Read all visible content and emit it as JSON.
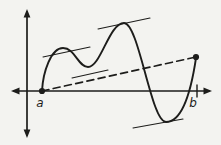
{
  "figure": {
    "name": "mean-value-theorem-diagram",
    "background_color": "#f3f3f0",
    "stroke_color": "#1d1d1b",
    "labels": {
      "a": "a",
      "b": "b"
    },
    "label_font_size": 12,
    "label_positions": {
      "a": [
        40,
        107
      ],
      "b": [
        193,
        107
      ]
    },
    "axes": [
      {
        "name": "x-axis",
        "line": [
          [
            14,
            91
          ],
          [
            209,
            91
          ]
        ],
        "arrow_tips": [
          [
            11,
            91
          ],
          [
            212,
            91
          ]
        ],
        "width": 1.7
      },
      {
        "name": "y-axis",
        "line": [
          [
            27,
            12
          ],
          [
            27,
            135
          ]
        ],
        "arrow_tips": [
          [
            27,
            9
          ],
          [
            27,
            138
          ]
        ],
        "width": 1.7
      }
    ],
    "curve": {
      "path": "M 42 91 C 43 72 51 48 63 48 C 75 48 78 67 88 67 C 101 67 109 23 124 23 C 139 23 151 122 166 122 C 178 122 189 105 196 58",
      "width": 1.9
    },
    "secant": {
      "from": [
        42,
        91
      ],
      "to": [
        196,
        57
      ],
      "dash": "7 4.5",
      "width": 1.7
    },
    "tangents": [
      {
        "from": [
          43,
          57
        ],
        "to": [
          90,
          47
        ]
      },
      {
        "from": [
          72,
          78
        ],
        "to": [
          108,
          70
        ]
      },
      {
        "from": [
          98,
          29
        ],
        "to": [
          150,
          18
        ]
      },
      {
        "from": [
          133,
          128
        ],
        "to": [
          183,
          119
        ]
      }
    ],
    "tangent_width": 1.1,
    "points": [
      {
        "name": "point-a",
        "cx": 42,
        "cy": 91,
        "r": 3.1
      },
      {
        "name": "point-f-b",
        "cx": 196,
        "cy": 57,
        "r": 3.1
      }
    ],
    "b_tick": {
      "from": [
        197,
        85
      ],
      "to": [
        197,
        97
      ],
      "width": 1.4
    }
  }
}
